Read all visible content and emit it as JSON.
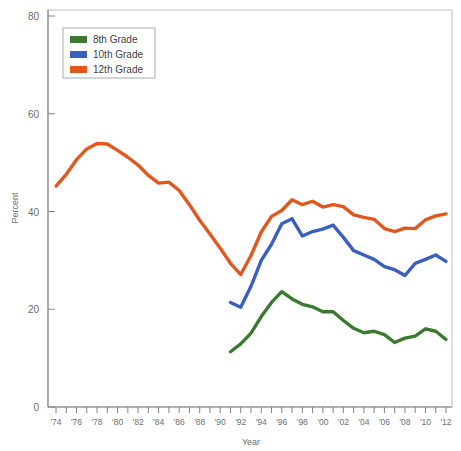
{
  "chart_data": {
    "type": "line",
    "title": "",
    "xlabel": "Year",
    "ylabel": "Percent",
    "ylim": [
      0,
      80
    ],
    "xlim": [
      1974,
      2012
    ],
    "yticks": [
      0,
      20,
      40,
      60,
      80
    ],
    "ytick_labels": [
      "0",
      "20",
      "40",
      "60",
      "80"
    ],
    "grid": false,
    "legend_position": "top-left",
    "x": [
      1974,
      1975,
      1976,
      1977,
      1978,
      1979,
      1980,
      1981,
      1982,
      1983,
      1984,
      1985,
      1986,
      1987,
      1988,
      1989,
      1990,
      1991,
      1992,
      1993,
      1994,
      1995,
      1996,
      1997,
      1998,
      1999,
      2000,
      2001,
      2002,
      2003,
      2004,
      2005,
      2006,
      2007,
      2008,
      2009,
      2010,
      2011,
      2012
    ],
    "xtick_labels": [
      "'74",
      "'75",
      "'76",
      "'77",
      "'78",
      "'79",
      "'80",
      "'81",
      "'82",
      "'83",
      "'84",
      "'85",
      "'86",
      "'87",
      "'88",
      "'89",
      "'90",
      "'91",
      "'92",
      "'93",
      "'94",
      "'95",
      "'96",
      "'97",
      "'98",
      "'99",
      "'00",
      "'01",
      "'02",
      "'03",
      "'04",
      "'05",
      "'06",
      "'07",
      "'08",
      "'09",
      "'10",
      "'11",
      "'12"
    ],
    "xtick_labels_shown": [
      "'74",
      "'76",
      "'78",
      "'80",
      "'82",
      "'84",
      "'86",
      "'88",
      "'90",
      "'92",
      "'94",
      "'96",
      "'98",
      "'00",
      "'02",
      "'04",
      "'06",
      "'08",
      "'10",
      "'12"
    ],
    "series": [
      {
        "name": "8th Grade",
        "color": "#3a7a2e",
        "x": [
          1991,
          1992,
          1993,
          1994,
          1995,
          1996,
          1997,
          1998,
          1999,
          2000,
          2001,
          2002,
          2003,
          2004,
          2005,
          2006,
          2007,
          2008,
          2009,
          2010,
          2011,
          2012
        ],
        "values": [
          11.3,
          12.9,
          15.1,
          18.5,
          21.4,
          23.6,
          22.1,
          21.0,
          20.5,
          19.5,
          19.5,
          17.7,
          16.1,
          15.2,
          15.5,
          14.8,
          13.2,
          14.1,
          14.5,
          16.0,
          15.5,
          13.8
        ]
      },
      {
        "name": "10th Grade",
        "color": "#3b5fbf",
        "x": [
          1991,
          1992,
          1993,
          1994,
          1995,
          1996,
          1997,
          1998,
          1999,
          2000,
          2001,
          2002,
          2003,
          2004,
          2005,
          2006,
          2007,
          2008,
          2009,
          2010,
          2011,
          2012
        ],
        "values": [
          21.4,
          20.4,
          24.7,
          30.0,
          33.3,
          37.5,
          38.5,
          35.0,
          35.9,
          36.4,
          37.2,
          34.7,
          32.0,
          31.1,
          30.2,
          28.7,
          28.1,
          26.9,
          29.4,
          30.2,
          31.1,
          29.8
        ]
      },
      {
        "name": "12th Grade",
        "color": "#e0581e",
        "x": [
          1974,
          1975,
          1976,
          1977,
          1978,
          1979,
          1980,
          1981,
          1982,
          1983,
          1984,
          1985,
          1986,
          1987,
          1988,
          1989,
          1990,
          1991,
          1992,
          1993,
          1994,
          1995,
          1996,
          1997,
          1998,
          1999,
          2000,
          2001,
          2002,
          2003,
          2004,
          2005,
          2006,
          2007,
          2008,
          2009,
          2010,
          2011,
          2012
        ],
        "values": [
          45.2,
          47.6,
          50.6,
          52.8,
          53.9,
          53.8,
          52.5,
          51.1,
          49.5,
          47.4,
          45.8,
          46.0,
          44.3,
          41.4,
          38.2,
          35.4,
          32.5,
          29.4,
          27.1,
          31.0,
          35.8,
          39.0,
          40.2,
          42.4,
          41.4,
          42.1,
          40.9,
          41.4,
          41.0,
          39.3,
          38.8,
          38.4,
          36.5,
          35.9,
          36.6,
          36.5,
          38.3,
          39.1,
          39.5
        ]
      }
    ]
  },
  "legend": {
    "items": [
      {
        "label": "8th Grade",
        "color": "#3a7a2e"
      },
      {
        "label": "10th Grade",
        "color": "#3b5fbf"
      },
      {
        "label": "12th Grade",
        "color": "#e0581e"
      }
    ]
  },
  "axes": {
    "y_title": "Percent",
    "x_title": "Year"
  }
}
